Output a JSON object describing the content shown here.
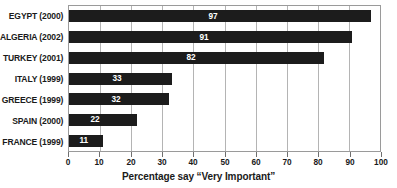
{
  "chart_data": {
    "type": "bar",
    "orientation": "horizontal",
    "title": "",
    "xlabel": "Percentage say “Very Important”",
    "ylabel": "",
    "xlim": [
      0,
      100
    ],
    "xticks": [
      0,
      10,
      20,
      30,
      40,
      50,
      60,
      70,
      80,
      90,
      100
    ],
    "grid": true,
    "legend": false,
    "categories": [
      "EGYPT (2000)",
      "ALGERIA (2002)",
      "TURKEY (2001)",
      "ITALY (1999)",
      "GREECE (1999)",
      "SPAIN (2000)",
      "FRANCE (1999)"
    ],
    "values": [
      97,
      91,
      82,
      33,
      32,
      22,
      11
    ],
    "value_labels": [
      "97",
      "91",
      "82",
      "33",
      "32",
      "22",
      "11"
    ],
    "colors": {
      "bar": "#1c1c1c",
      "value_label": "#ffffff",
      "gridline": "#b4b4b4",
      "axis": "#9a9a9a",
      "text": "#1a1a1a",
      "background": "#ffffff"
    }
  }
}
